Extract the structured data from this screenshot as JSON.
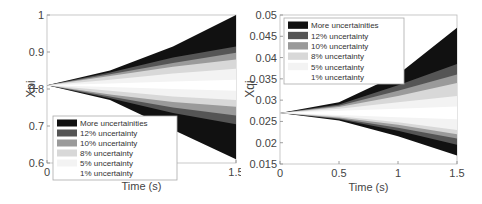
{
  "chart_data": [
    {
      "type": "area",
      "title": "",
      "xlabel": "Time (s)",
      "ylabel": "Xpi",
      "xlim": [
        0,
        1.5
      ],
      "ylim": [
        0.6,
        1.0
      ],
      "xticks": [
        "0",
        "1",
        "1.5"
      ],
      "yticks": [
        "0.6",
        "0.7",
        "0.8",
        "0.9",
        "1"
      ],
      "grid": false,
      "legend_position": "lower left",
      "legend": [
        "More uncertainities",
        "12% uncertainty",
        "10% uncertainty",
        "8% uncertainty",
        "5% uncertainty",
        "1% uncertainty"
      ],
      "x": [
        0,
        0.5,
        1.0,
        1.5
      ],
      "series": [
        {
          "name": "More uncertainities",
          "color": "#111111",
          "upper": [
            0.81,
            0.85,
            0.915,
            1.0
          ],
          "lower": [
            0.81,
            0.77,
            0.69,
            0.61
          ]
        },
        {
          "name": "12% uncertainty",
          "color": "#555555",
          "upper": [
            0.81,
            0.845,
            0.885,
            0.915
          ],
          "lower": [
            0.81,
            0.775,
            0.735,
            0.705
          ]
        },
        {
          "name": "10% uncertainty",
          "color": "#9a9a9a",
          "upper": [
            0.81,
            0.84,
            0.87,
            0.898
          ],
          "lower": [
            0.81,
            0.78,
            0.75,
            0.728
          ]
        },
        {
          "name": "8% uncertainty",
          "color": "#d8d8d8",
          "upper": [
            0.81,
            0.835,
            0.86,
            0.88
          ],
          "lower": [
            0.81,
            0.785,
            0.765,
            0.752
          ]
        },
        {
          "name": "5% uncertainty",
          "color": "#f3f3f3",
          "upper": [
            0.81,
            0.825,
            0.842,
            0.855
          ],
          "lower": [
            0.81,
            0.795,
            0.78,
            0.77
          ]
        },
        {
          "name": "1% uncertainty",
          "color": "#ffffff",
          "upper": [
            0.81,
            0.815,
            0.82,
            0.825
          ],
          "lower": [
            0.81,
            0.805,
            0.8,
            0.795
          ]
        }
      ]
    },
    {
      "type": "area",
      "title": "",
      "xlabel": "Time (s)",
      "ylabel": "Xqi",
      "xlim": [
        0,
        1.5
      ],
      "ylim": [
        0.015,
        0.05
      ],
      "xticks": [
        "0",
        "0.5",
        "1",
        "1.5"
      ],
      "yticks": [
        "0.015",
        "0.02",
        "0.025",
        "0.03",
        "0.035",
        "0.04",
        "0.045",
        "0.05"
      ],
      "grid": false,
      "legend_position": "upper left",
      "legend": [
        "More uncertainities",
        "12% uncertainty",
        "10% uncertainty",
        "8% uncertainty",
        "5% uncertainty",
        "1% uncertainty"
      ],
      "x": [
        0,
        0.5,
        1.0,
        1.5
      ],
      "series": [
        {
          "name": "More uncertainities",
          "color": "#111111",
          "upper": [
            0.027,
            0.0295,
            0.036,
            0.047
          ],
          "lower": [
            0.027,
            0.0252,
            0.0215,
            0.017
          ]
        },
        {
          "name": "12% uncertainty",
          "color": "#555555",
          "upper": [
            0.027,
            0.029,
            0.0335,
            0.0385
          ],
          "lower": [
            0.027,
            0.0255,
            0.0228,
            0.0195
          ]
        },
        {
          "name": "10% uncertainty",
          "color": "#9a9a9a",
          "upper": [
            0.027,
            0.0287,
            0.0322,
            0.036
          ],
          "lower": [
            0.027,
            0.0257,
            0.0235,
            0.021
          ]
        },
        {
          "name": "8% uncertainty",
          "color": "#d8d8d8",
          "upper": [
            0.027,
            0.0284,
            0.031,
            0.034
          ],
          "lower": [
            0.027,
            0.0259,
            0.0242,
            0.022
          ]
        },
        {
          "name": "5% uncertainty",
          "color": "#f3f3f3",
          "upper": [
            0.027,
            0.028,
            0.0295,
            0.031
          ],
          "lower": [
            0.027,
            0.0262,
            0.0248,
            0.023
          ]
        },
        {
          "name": "1% uncertainty",
          "color": "#ffffff",
          "upper": [
            0.027,
            0.0275,
            0.028,
            0.0285
          ],
          "lower": [
            0.027,
            0.0265,
            0.026,
            0.0255
          ]
        }
      ]
    }
  ]
}
